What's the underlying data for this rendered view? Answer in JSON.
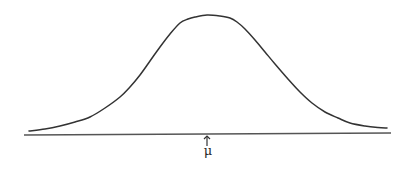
{
  "diagram": {
    "title": "",
    "type": "normal-distribution-curve",
    "mean_label": "μ",
    "stroke_color": "#333333",
    "baseline_color": "#555555",
    "background": "#ffffff",
    "curve_points": [
      [
        29,
        131
      ],
      [
        45,
        129
      ],
      [
        60,
        126
      ],
      [
        75,
        122
      ],
      [
        90,
        117
      ],
      [
        105,
        108
      ],
      [
        120,
        97
      ],
      [
        130,
        87
      ],
      [
        140,
        75
      ],
      [
        150,
        61
      ],
      [
        160,
        47
      ],
      [
        170,
        34
      ],
      [
        180,
        23
      ],
      [
        188,
        19
      ],
      [
        195,
        17
      ],
      [
        207,
        15
      ],
      [
        220,
        16
      ],
      [
        230,
        18
      ],
      [
        237,
        22
      ],
      [
        245,
        29
      ],
      [
        255,
        40
      ],
      [
        265,
        52
      ],
      [
        275,
        64
      ],
      [
        288,
        79
      ],
      [
        300,
        92
      ],
      [
        312,
        103
      ],
      [
        325,
        112
      ],
      [
        338,
        118
      ],
      [
        350,
        123
      ],
      [
        365,
        126
      ],
      [
        378,
        127.5
      ],
      [
        387,
        128
      ]
    ],
    "baseline": {
      "x1": 24,
      "y1": 135,
      "x2": 391,
      "y2": 133
    },
    "mean_arrow": {
      "x": 207,
      "y_top": 135,
      "y_bottom": 146
    }
  }
}
